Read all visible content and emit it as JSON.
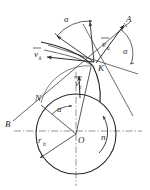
{
  "figure": {
    "type": "kinematic-geometry-diagram",
    "title": "",
    "background_color": "#ffffff",
    "stroke_color": "#2b2b2b",
    "light_stroke_color": "#6a6a6a"
  },
  "points": [
    {
      "id": "K",
      "label": "K",
      "x": 96,
      "y": 64,
      "role": "contact-point"
    },
    {
      "id": "O",
      "label": "O",
      "x": 76,
      "y": 134,
      "role": "circle-center"
    },
    {
      "id": "N",
      "label": "N",
      "x": 41,
      "y": 103,
      "role": "tangent-point"
    },
    {
      "id": "A",
      "label": "A",
      "x": 128,
      "y": 19,
      "role": "line-end-upper-right"
    },
    {
      "id": "B",
      "label": "B",
      "x": 9,
      "y": 123,
      "role": "line-end-lower-left"
    }
  ],
  "vectors": [
    {
      "id": "v_a",
      "label": "v",
      "subscript": "a",
      "x": 105,
      "y": 43,
      "direction": "upper-right"
    },
    {
      "id": "v_k",
      "label": "v",
      "subscript": "k",
      "x": 39,
      "y": 54,
      "direction": "left"
    },
    {
      "id": "v_t",
      "label": "v",
      "subscript": "t",
      "x": 78,
      "y": 81,
      "direction": "up"
    }
  ],
  "dimensions": [
    {
      "id": "r_b",
      "label": "r",
      "subscript": "b",
      "x": 41,
      "y": 140,
      "meaning": "base-circle-radius"
    }
  ],
  "angles": [
    {
      "id": "alpha-top",
      "label": "α",
      "x": 68,
      "y": 19,
      "meaning": "pressure-angle"
    },
    {
      "id": "alpha-right",
      "label": "α",
      "x": 126,
      "y": 50,
      "meaning": "pressure-angle"
    },
    {
      "id": "alpha-lower",
      "label": "α",
      "x": 61,
      "y": 108,
      "meaning": "pressure-angle"
    }
  ],
  "rotation": {
    "id": "n",
    "label": "n",
    "x": 103,
    "y": 136,
    "meaning": "rotation-speed-direction"
  },
  "circle": {
    "center_x": 76,
    "center_y": 134,
    "radius": 40,
    "label": "base-circle"
  },
  "axes": {
    "horizontal": {
      "y": 131,
      "x1": 14,
      "x2": 142,
      "style": "dash-dot"
    },
    "vertical": {
      "x": 76,
      "y1": 74,
      "y2": 186,
      "style": "dash-dot"
    }
  }
}
